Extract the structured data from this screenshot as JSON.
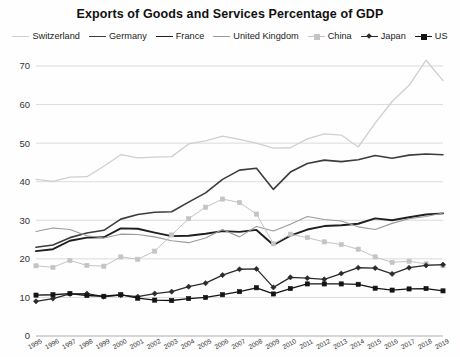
{
  "chart_data": {
    "type": "line",
    "title": "Exports of Goods and Services Percentage of GDP",
    "xlabel": "",
    "ylabel": "",
    "ylim": [
      0,
      70
    ],
    "yticks": [
      0,
      10,
      20,
      30,
      40,
      50,
      60,
      70
    ],
    "grid": true,
    "legend_position": "top",
    "x": [
      1995,
      1996,
      1997,
      1998,
      1999,
      2000,
      2001,
      2002,
      2003,
      2004,
      2005,
      2006,
      2007,
      2008,
      2009,
      2010,
      2011,
      2012,
      2013,
      2014,
      2015,
      2016,
      2017,
      2018,
      2019
    ],
    "categories": [
      "1995",
      "1996",
      "1997",
      "1998",
      "1999",
      "2000",
      "2001",
      "2002",
      "2003",
      "2004",
      "2005",
      "2006",
      "2007",
      "2008",
      "2009",
      "2010",
      "2011",
      "2012",
      "2013",
      "2014",
      "2015",
      "2016",
      "2017",
      "2018",
      "2019"
    ],
    "series": [
      {
        "name": "Switzerland",
        "color": "#cfcfcf",
        "marker": "none",
        "width": 1.3,
        "values": [
          40.6,
          40.1,
          41.2,
          41.3,
          44.0,
          47.0,
          46.2,
          46.4,
          46.5,
          49.8,
          50.6,
          51.8,
          51.0,
          50.0,
          48.7,
          48.8,
          51.1,
          52.4,
          52.1,
          49.0,
          55.2,
          60.8,
          65.0,
          71.5,
          66.2
        ]
      },
      {
        "name": "Germany",
        "color": "#3c3c3c",
        "marker": "none",
        "width": 1.6,
        "values": [
          23.0,
          23.6,
          25.5,
          26.7,
          27.4,
          30.3,
          31.5,
          32.1,
          32.2,
          34.7,
          37.1,
          40.6,
          43.0,
          43.5,
          38.0,
          42.5,
          44.7,
          45.6,
          45.2,
          45.7,
          46.8,
          46.1,
          46.9,
          47.2,
          47.0
        ]
      },
      {
        "name": "France",
        "color": "#1f1f1f",
        "marker": "none",
        "width": 1.9,
        "values": [
          22.0,
          22.5,
          24.7,
          25.5,
          25.6,
          27.9,
          27.8,
          26.8,
          25.9,
          26.0,
          26.5,
          27.2,
          27.0,
          27.5,
          23.6,
          26.0,
          27.6,
          28.5,
          28.7,
          29.1,
          30.5,
          30.0,
          30.8,
          31.5,
          31.8
        ]
      },
      {
        "name": "United Kingdom",
        "color": "#9a9a9a",
        "marker": "none",
        "width": 1.1,
        "values": [
          27.1,
          28.0,
          27.6,
          26.0,
          25.4,
          26.4,
          26.3,
          25.7,
          24.7,
          24.2,
          25.4,
          27.6,
          25.7,
          28.4,
          27.2,
          29.0,
          31.0,
          30.2,
          29.8,
          28.3,
          27.6,
          29.2,
          30.4,
          31.0,
          31.9
        ]
      },
      {
        "name": "China",
        "color": "#c4c4c4",
        "marker": "square",
        "width": 1.0,
        "values": [
          18.2,
          17.8,
          19.6,
          18.3,
          18.1,
          20.5,
          19.9,
          22.0,
          26.2,
          30.4,
          33.4,
          35.5,
          34.6,
          31.6,
          23.9,
          26.4,
          25.5,
          24.4,
          23.7,
          22.5,
          20.5,
          19.1,
          19.4,
          18.7,
          18.2
        ]
      },
      {
        "name": "Japan",
        "color": "#2b2b2b",
        "marker": "diamond",
        "width": 1.3,
        "values": [
          9.0,
          9.7,
          10.9,
          11.0,
          10.2,
          10.6,
          10.2,
          11.0,
          11.5,
          12.8,
          13.7,
          15.8,
          17.3,
          17.4,
          12.6,
          15.2,
          15.0,
          14.7,
          16.2,
          17.7,
          17.6,
          16.1,
          17.7,
          18.3,
          18.5
        ]
      },
      {
        "name": "US",
        "color": "#141414",
        "marker": "square",
        "width": 1.3,
        "values": [
          10.6,
          10.7,
          11.0,
          10.5,
          10.3,
          10.7,
          9.8,
          9.3,
          9.2,
          9.7,
          10.0,
          10.7,
          11.5,
          12.5,
          10.9,
          12.3,
          13.5,
          13.5,
          13.5,
          13.4,
          12.4,
          11.9,
          12.2,
          12.3,
          11.7
        ]
      }
    ]
  }
}
